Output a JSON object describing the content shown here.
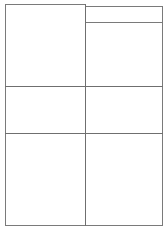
{
  "page": {
    "background_color": "#ffffff",
    "width": 167,
    "height": 233
  },
  "styles": {
    "border_color": "#7a7a7a",
    "divider_color": "#6f6f6f",
    "panel_fill": "#ffffff"
  },
  "layout": {
    "frame": {
      "label": ""
    },
    "left_column": {
      "label": ""
    },
    "right_column": {
      "label": ""
    },
    "right_header": {
      "label": ""
    },
    "dividers": {
      "row_1": {
        "label": ""
      },
      "row_2": {
        "label": ""
      },
      "column": {
        "label": ""
      }
    },
    "cells": [
      {
        "id": "top-left",
        "label": ""
      },
      {
        "id": "top-right",
        "label": ""
      },
      {
        "id": "middle-left",
        "label": ""
      },
      {
        "id": "middle-right",
        "label": ""
      },
      {
        "id": "bottom-left",
        "label": ""
      },
      {
        "id": "bottom-right",
        "label": ""
      }
    ]
  }
}
